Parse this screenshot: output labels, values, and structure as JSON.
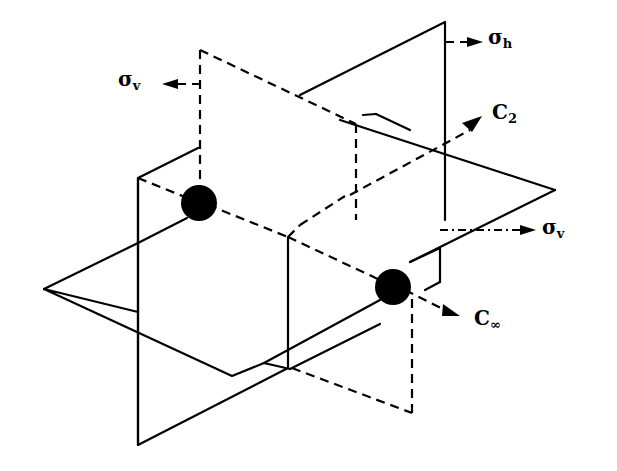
{
  "diagram": {
    "labels": {
      "sigma_h": {
        "symbol": "σ",
        "subscript": "h"
      },
      "sigma_v_left": {
        "symbol": "σ",
        "subscript": "v"
      },
      "c2": {
        "symbol": "C",
        "subscript": "2"
      },
      "sigma_v_right": {
        "symbol": "σ",
        "subscript": "v"
      },
      "c_inf": {
        "symbol": "C",
        "subscript": "∞"
      }
    },
    "elements": [
      {
        "id": "sigma_h",
        "type": "horizontal mirror plane"
      },
      {
        "id": "sigma_v_left",
        "type": "vertical mirror plane (dashed, back)"
      },
      {
        "id": "sigma_v_right",
        "type": "vertical mirror plane (solid, front)"
      },
      {
        "id": "c2",
        "type": "two-fold rotation axis"
      },
      {
        "id": "c_inf",
        "type": "infinite-fold rotation axis (molecular axis)"
      }
    ],
    "atoms": 2,
    "colors": {
      "ink": "#000000",
      "background": "#ffffff"
    }
  }
}
